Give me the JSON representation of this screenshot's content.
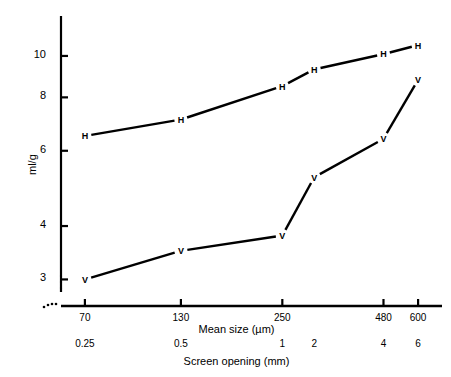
{
  "chart_data": {
    "type": "line",
    "title": "",
    "xlabel": "Mean size (µm)",
    "xlabel2": "Screen opening (mm)",
    "ylabel": "ml/g",
    "xscale": "log",
    "yscale": "log",
    "grid": false,
    "legend": "none",
    "xlim": [
      60,
      700
    ],
    "ylim": [
      2.6,
      11.5
    ],
    "x_ticks": [
      70,
      130,
      250,
      480,
      600
    ],
    "x_tick_labels": [
      "70",
      "130",
      "250",
      "480",
      "600"
    ],
    "x_ticks2": [
      70,
      130,
      250,
      307,
      480,
      600
    ],
    "x_tick_labels2": [
      "0.25",
      "0.5",
      "1",
      "2",
      "4",
      "6"
    ],
    "y_ticks": [
      3,
      4,
      6,
      8,
      10
    ],
    "y_tick_labels": [
      "3",
      "4",
      "6",
      "8",
      "10"
    ],
    "broken_axis": true,
    "series": [
      {
        "name": "H",
        "marker": "H",
        "x": [
          70,
          130,
          250,
          307,
          480,
          600
        ],
        "values": [
          6.5,
          7.1,
          8.5,
          9.3,
          10.1,
          10.6
        ]
      },
      {
        "name": "V",
        "marker": "V",
        "x": [
          70,
          130,
          250,
          307,
          480,
          600
        ],
        "values": [
          3.0,
          3.5,
          3.8,
          5.2,
          6.4,
          8.8
        ]
      }
    ]
  }
}
